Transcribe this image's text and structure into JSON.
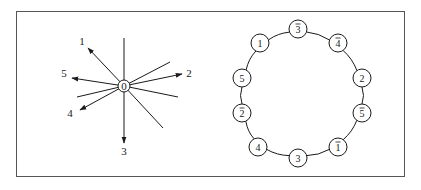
{
  "figure": {
    "border_color": "#555555",
    "stroke_color": "#1a1a1a",
    "star": {
      "center": {
        "label": "0",
        "x": 124,
        "y": 86,
        "r": 6
      },
      "arrows": [
        {
          "label": "1",
          "tip_x": 88,
          "tip_y": 48,
          "label_x": 82,
          "label_y": 45
        },
        {
          "label": "2",
          "tip_x": 182,
          "tip_y": 74,
          "label_x": 189,
          "label_y": 77
        },
        {
          "label": "3",
          "tip_x": 124,
          "tip_y": 143,
          "label_x": 124,
          "label_y": 155
        },
        {
          "label": "4",
          "tip_x": 80,
          "tip_y": 110,
          "label_x": 70,
          "label_y": 117
        },
        {
          "label": "5",
          "tip_x": 72,
          "tip_y": 78,
          "label_x": 64,
          "label_y": 77
        }
      ],
      "lines": [
        {
          "x": 124,
          "y": 38
        },
        {
          "x": 170,
          "y": 62
        },
        {
          "x": 178,
          "y": 97
        },
        {
          "x": 163,
          "y": 128
        },
        {
          "x": 77,
          "y": 97
        }
      ]
    },
    "ring": {
      "nodes": [
        {
          "label": "3",
          "bar": true,
          "x": 298,
          "y": 29
        },
        {
          "label": "4",
          "bar": true,
          "x": 338,
          "y": 43
        },
        {
          "label": "2",
          "bar": false,
          "x": 362,
          "y": 78
        },
        {
          "label": "5",
          "bar": true,
          "x": 362,
          "y": 113
        },
        {
          "label": "1",
          "bar": true,
          "x": 338,
          "y": 147
        },
        {
          "label": "3",
          "bar": false,
          "x": 298,
          "y": 158
        },
        {
          "label": "4",
          "bar": false,
          "x": 258,
          "y": 147
        },
        {
          "label": "2",
          "bar": true,
          "x": 242,
          "y": 113
        },
        {
          "label": "5",
          "bar": false,
          "x": 242,
          "y": 78
        },
        {
          "label": "1",
          "bar": false,
          "x": 260,
          "y": 43
        }
      ],
      "node_r": 9
    }
  }
}
